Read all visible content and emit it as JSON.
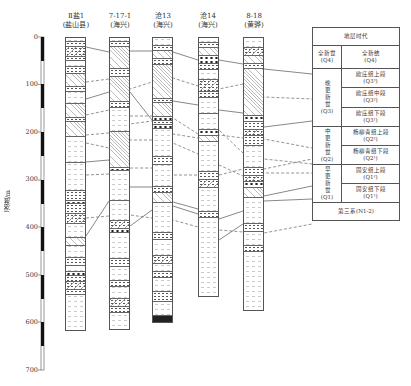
{
  "diagram": {
    "type": "stratigraphic-correlation",
    "axis": {
      "title": "深度/m",
      "unit": "m",
      "ticks": [
        "0",
        "100",
        "200",
        "300",
        "400",
        "500",
        "600",
        "700"
      ]
    },
    "columns": [
      {
        "id": "col1",
        "name": "Ⅱ盐1",
        "location": "(盐山县)",
        "bottom_depth": 620
      },
      {
        "id": "col2",
        "name": "7-17-1",
        "location": "(海兴)",
        "bottom_depth": 618
      },
      {
        "id": "col3",
        "name": "沧13",
        "location": "(海兴)",
        "bottom_depth": 595
      },
      {
        "id": "col4",
        "name": "沧14",
        "location": "(海兴)",
        "bottom_depth": 545
      },
      {
        "id": "col5",
        "name": "8-18",
        "location": "(黄骅)",
        "bottom_depth": 575
      }
    ],
    "legend_table": {
      "header": "地层时代",
      "groups": [
        {
          "era": "全新世",
          "era_code": "(Q4)",
          "units": [
            {
              "name": "全新统",
              "code": "(Q4)"
            }
          ]
        },
        {
          "era": "晚更新世",
          "era_code": "(Q3)",
          "units": [
            {
              "name": "欧庄组上段",
              "code": "(Q3³)"
            },
            {
              "name": "欧庄组中段",
              "code": "(Q3²)"
            },
            {
              "name": "欧庄组下段",
              "code": "(Q3¹)"
            }
          ]
        },
        {
          "era": "中更新世",
          "era_code": "(Q2)",
          "units": [
            {
              "name": "杨柳青组上段",
              "code": "(Q2²)"
            },
            {
              "name": "杨柳青组下段",
              "code": "(Q2¹)"
            }
          ]
        },
        {
          "era": "早更新世",
          "era_code": "(Q1)",
          "units": [
            {
              "name": "固安组上段",
              "code": "(Q1²)"
            },
            {
              "name": "固安组下段",
              "code": "(Q1¹)"
            }
          ]
        }
      ],
      "footer": "第三系(N1-2)"
    }
  }
}
